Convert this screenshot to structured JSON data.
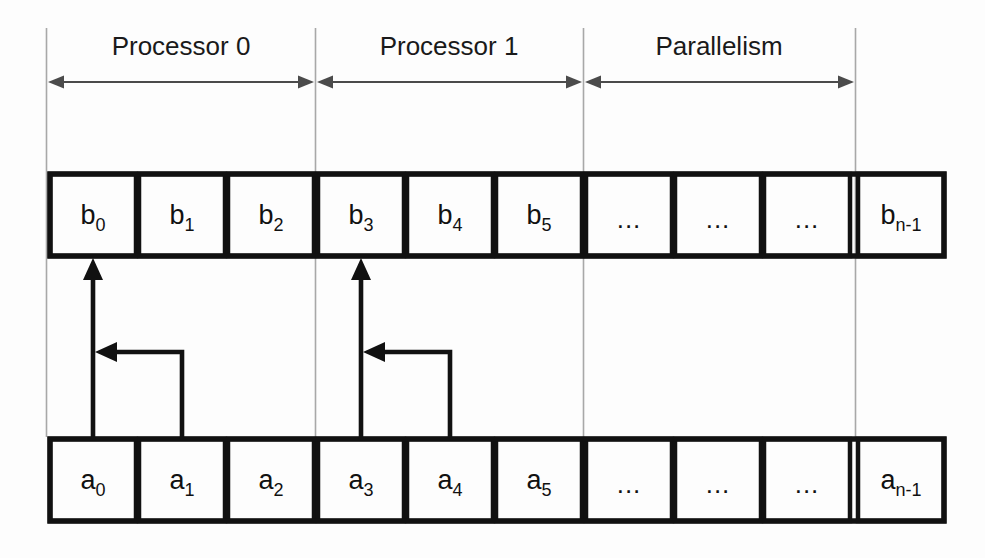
{
  "diagram": {
    "colors": {
      "background": "#fdfdfd",
      "cell_border": "#111111",
      "guide_line": "#a8a8a8",
      "dimension_arrow": "#4b4b4b",
      "flow_arrow": "#111111",
      "text": "#111111"
    },
    "regions": [
      {
        "label": "Processor 0",
        "start_index": 0,
        "end_index": 2
      },
      {
        "label": "Processor 1",
        "start_index": 3,
        "end_index": 5
      },
      {
        "label": "Parallelism",
        "start_index": 6,
        "end_index": 9
      }
    ],
    "rows": [
      {
        "name": "output-row",
        "array": "b",
        "cells": [
          {
            "base": "b",
            "sub": "0",
            "text": "b0"
          },
          {
            "base": "b",
            "sub": "1",
            "text": "b1"
          },
          {
            "base": "b",
            "sub": "2",
            "text": "b2"
          },
          {
            "base": "b",
            "sub": "3",
            "text": "b3"
          },
          {
            "base": "b",
            "sub": "4",
            "text": "b4"
          },
          {
            "base": "b",
            "sub": "5",
            "text": "b5"
          },
          {
            "base": "",
            "sub": "",
            "text": "..."
          },
          {
            "base": "",
            "sub": "",
            "text": "..."
          },
          {
            "base": "",
            "sub": "",
            "text": "..."
          },
          {
            "base": "b",
            "sub": "n-1",
            "text": "bn-1"
          }
        ]
      },
      {
        "name": "input-row",
        "array": "a",
        "cells": [
          {
            "base": "a",
            "sub": "0",
            "text": "a0"
          },
          {
            "base": "a",
            "sub": "1",
            "text": "a1"
          },
          {
            "base": "a",
            "sub": "2",
            "text": "a2"
          },
          {
            "base": "a",
            "sub": "3",
            "text": "a3"
          },
          {
            "base": "a",
            "sub": "4",
            "text": "a4"
          },
          {
            "base": "a",
            "sub": "5",
            "text": "a5"
          },
          {
            "base": "",
            "sub": "",
            "text": "..."
          },
          {
            "base": "",
            "sub": "",
            "text": "..."
          },
          {
            "base": "",
            "sub": "",
            "text": "..."
          },
          {
            "base": "a",
            "sub": "n-1",
            "text": "an-1"
          }
        ]
      }
    ],
    "dependency_arrows": [
      {
        "from_cell": "a0",
        "to_cell": "b0",
        "secondary_from": "a1",
        "group": 0
      },
      {
        "from_cell": "a3",
        "to_cell": "b3",
        "secondary_from": "a4",
        "group": 1
      }
    ]
  }
}
